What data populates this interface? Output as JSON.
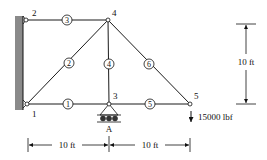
{
  "diagram": {
    "type": "truss",
    "nodes": [
      {
        "id": "1",
        "label": "1",
        "x": 27,
        "y": 104
      },
      {
        "id": "2",
        "label": "2",
        "x": 26,
        "y": 20
      },
      {
        "id": "3",
        "label": "3",
        "x": 109,
        "y": 104
      },
      {
        "id": "4",
        "label": "4",
        "x": 108,
        "y": 20
      },
      {
        "id": "5",
        "label": "5",
        "x": 190,
        "y": 104
      }
    ],
    "members": [
      {
        "id": "1",
        "label": "1",
        "from": "1",
        "to": "3"
      },
      {
        "id": "2",
        "label": "2",
        "from": "1",
        "to": "4"
      },
      {
        "id": "3",
        "label": "3",
        "from": "2",
        "to": "4"
      },
      {
        "id": "4",
        "label": "4",
        "from": "3",
        "to": "4"
      },
      {
        "id": "5",
        "label": "5",
        "from": "3",
        "to": "5"
      },
      {
        "id": "6",
        "label": "6",
        "from": "4",
        "to": "5"
      }
    ],
    "support_label": "A",
    "load_label": "15000 lbf",
    "dimensions": {
      "horizontal_left": "10 ft",
      "horizontal_right": "10 ft",
      "vertical": "10 ft"
    },
    "colors": {
      "line": "#1a1a1a",
      "wall_fill": "#8a8a8a",
      "background": "#ffffff"
    }
  }
}
